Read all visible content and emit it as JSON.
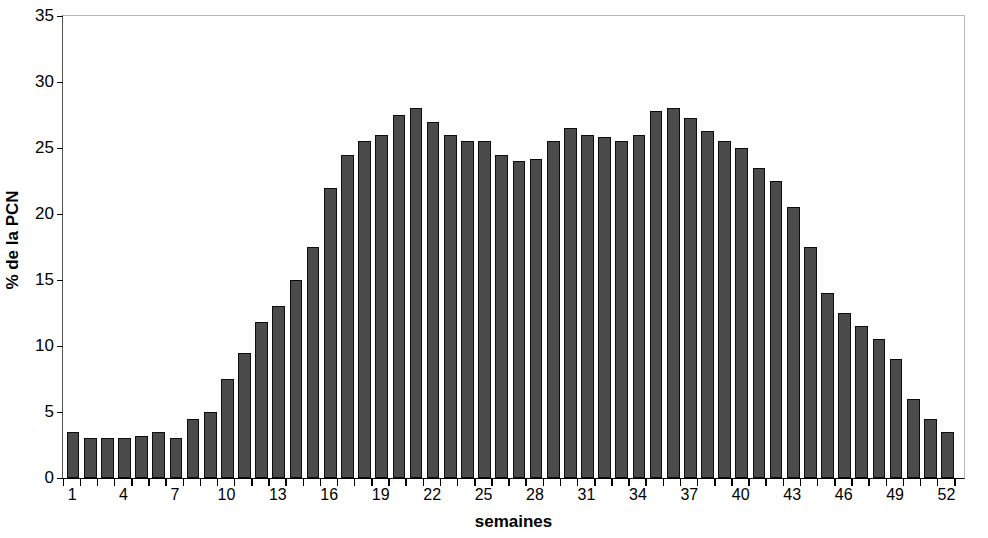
{
  "chart_data": {
    "type": "bar",
    "title": "",
    "subtitle": "",
    "xlabel": "semaines",
    "ylabel": "% de la PCN",
    "xlim": [
      0,
      53
    ],
    "ylim": [
      0,
      35
    ],
    "yticks": [
      0,
      5,
      10,
      15,
      20,
      25,
      30,
      35
    ],
    "xticks": [
      1,
      4,
      7,
      10,
      13,
      16,
      19,
      22,
      25,
      28,
      31,
      34,
      37,
      40,
      43,
      46,
      49,
      52
    ],
    "grid": false,
    "legend": null,
    "bar_color": "#4b4b4b",
    "bar_edge_color": "#0d0d0d",
    "categories": [
      1,
      2,
      3,
      4,
      5,
      6,
      7,
      8,
      9,
      10,
      11,
      12,
      13,
      14,
      15,
      16,
      17,
      18,
      19,
      20,
      21,
      22,
      23,
      24,
      25,
      26,
      27,
      28,
      29,
      30,
      31,
      32,
      33,
      34,
      35,
      36,
      37,
      38,
      39,
      40,
      41,
      42,
      43,
      44,
      45,
      46,
      47,
      48,
      49,
      50,
      51,
      52
    ],
    "values": [
      3.5,
      3.0,
      3.0,
      3.0,
      3.2,
      3.5,
      3.0,
      4.5,
      5.0,
      7.5,
      9.5,
      11.8,
      13.0,
      15.0,
      17.5,
      22.0,
      24.5,
      25.5,
      26.0,
      27.5,
      28.0,
      27.0,
      26.0,
      25.5,
      25.5,
      24.5,
      24.0,
      24.2,
      25.5,
      26.5,
      26.0,
      25.8,
      25.5,
      26.0,
      27.8,
      28.0,
      27.3,
      26.3,
      25.5,
      25.0,
      23.5,
      22.5,
      20.5,
      17.5,
      14.0,
      12.5,
      11.5,
      10.5,
      9.0,
      6.0,
      4.5,
      3.5
    ]
  },
  "axes": {
    "y_title": "% de la PCN",
    "x_title": "semaines",
    "y_tick_labels": [
      "0",
      "5",
      "10",
      "15",
      "20",
      "25",
      "30",
      "35"
    ],
    "x_tick_labels": [
      "1",
      "4",
      "7",
      "10",
      "13",
      "16",
      "19",
      "22",
      "25",
      "28",
      "31",
      "34",
      "37",
      "40",
      "43",
      "46",
      "49",
      "52"
    ]
  }
}
